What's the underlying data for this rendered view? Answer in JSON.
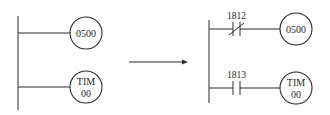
{
  "diagram": {
    "type": "ladder-logic-transformation",
    "before": {
      "rungs": [
        {
          "coil": {
            "line1": "0500",
            "line2": ""
          }
        },
        {
          "coil": {
            "line1": "TIM",
            "line2": "00"
          }
        }
      ]
    },
    "arrow": {
      "direction": "right"
    },
    "after": {
      "rungs": [
        {
          "contact": {
            "type": "normally-closed",
            "address": "1812"
          },
          "coil": {
            "line1": "0500",
            "line2": ""
          }
        },
        {
          "contact": {
            "type": "normally-open",
            "address": "1813"
          },
          "coil": {
            "line1": "TIM",
            "line2": "00"
          }
        }
      ]
    },
    "colors": {
      "line": "#2a2a2a",
      "background": "#ffffff"
    }
  }
}
